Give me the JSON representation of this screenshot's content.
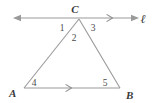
{
  "figure": {
    "background_color": "#ffffff",
    "stroke_color": "#9a9a9a",
    "text_color": "#3a3a3a"
  },
  "vertices": {
    "C": {
      "label": "C",
      "x": 79,
      "y": 18,
      "label_x": 75,
      "label_y": 13
    },
    "A": {
      "label": "A",
      "x": 24,
      "y": 88,
      "label_x": 8,
      "label_y": 95
    },
    "B": {
      "label": "B",
      "x": 120,
      "y": 88,
      "label_x": 127,
      "label_y": 97
    }
  },
  "line": {
    "name": "line-l",
    "label": "ℓ",
    "label_x": 143,
    "label_y": 22,
    "y": 18,
    "x_start": 13,
    "x_end": 138
  },
  "angles": [
    {
      "id": 1,
      "label": "1",
      "x": 62,
      "y": 28,
      "at_vertex": "C"
    },
    {
      "id": 2,
      "label": "2",
      "x": 73,
      "y": 38,
      "at_vertex": "C"
    },
    {
      "id": 3,
      "label": "3",
      "x": 92,
      "y": 28,
      "at_vertex": "C"
    },
    {
      "id": 4,
      "label": "4",
      "x": 33,
      "y": 85,
      "at_vertex": "A"
    },
    {
      "id": 5,
      "label": "5",
      "x": 104,
      "y": 85,
      "at_vertex": "B"
    }
  ],
  "parallel_markers": [
    {
      "name": "marker-on-line-l",
      "x": 111,
      "y": 18
    },
    {
      "name": "marker-on-segment-ab",
      "x": 70,
      "y": 88
    }
  ]
}
